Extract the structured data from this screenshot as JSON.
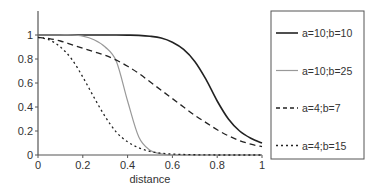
{
  "chart_data": {
    "type": "line",
    "title": "",
    "xlabel": "distance",
    "ylabel": "",
    "xlim": [
      0,
      1
    ],
    "ylim": [
      0,
      1.2
    ],
    "grid": false,
    "legend_position": "right, outside box",
    "x_ticks": [
      "0",
      "0.2",
      "0.4",
      "0.6",
      "0.8",
      "1"
    ],
    "y_ticks": [
      "0",
      "0.2",
      "0.4",
      "0.6",
      "0.8",
      "1"
    ],
    "x": [
      0,
      0.05,
      0.1,
      0.15,
      0.2,
      0.25,
      0.3,
      0.35,
      0.4,
      0.45,
      0.5,
      0.55,
      0.6,
      0.65,
      0.7,
      0.75,
      0.8,
      0.85,
      0.9,
      0.95,
      1.0
    ],
    "series": [
      {
        "name": "a=10;b=10",
        "style": "solid",
        "color": "#222222",
        "width": 1.6,
        "values": [
          1.0,
          1.0,
          1.0,
          1.0,
          1.0,
          1.0,
          1.0,
          1.0,
          0.999,
          0.997,
          0.99,
          0.975,
          0.94,
          0.88,
          0.78,
          0.63,
          0.45,
          0.3,
          0.2,
          0.14,
          0.1
        ]
      },
      {
        "name": "a=10;b=25",
        "style": "solid",
        "color": "#999999",
        "width": 1.2,
        "values": [
          1.0,
          1.0,
          1.0,
          1.0,
          0.99,
          0.96,
          0.9,
          0.78,
          0.45,
          0.15,
          0.04,
          0.01,
          0.0,
          0.0,
          0.0,
          0.0,
          0.0,
          0.0,
          0.0,
          0.0,
          0.0
        ]
      },
      {
        "name": "a=4;b=7",
        "style": "dashed",
        "color": "#222222",
        "width": 1.3,
        "values": [
          0.98,
          0.97,
          0.95,
          0.92,
          0.89,
          0.86,
          0.83,
          0.79,
          0.74,
          0.68,
          0.61,
          0.54,
          0.47,
          0.4,
          0.33,
          0.27,
          0.21,
          0.16,
          0.12,
          0.09,
          0.07
        ]
      },
      {
        "name": "a=4;b=15",
        "style": "dotted",
        "color": "#222222",
        "width": 1.3,
        "values": [
          0.98,
          0.96,
          0.9,
          0.8,
          0.65,
          0.48,
          0.32,
          0.19,
          0.11,
          0.06,
          0.03,
          0.015,
          0.008,
          0.004,
          0.002,
          0.001,
          0.0,
          0.0,
          0.0,
          0.0,
          0.0
        ]
      }
    ]
  },
  "legend": {
    "items": [
      {
        "label": "a=10;b=10"
      },
      {
        "label": "a=10;b=25"
      },
      {
        "label": "a=4;b=7"
      },
      {
        "label": "a=4;b=15"
      }
    ]
  },
  "axes": {
    "xlabel": "distance",
    "x_ticks": [
      "0",
      "0.2",
      "0.4",
      "0.6",
      "0.8",
      "1"
    ],
    "y_ticks": [
      "0",
      "0.2",
      "0.4",
      "0.6",
      "0.8",
      "1"
    ]
  }
}
